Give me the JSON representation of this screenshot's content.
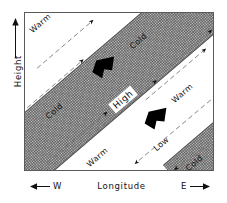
{
  "figure": {
    "type": "meteorological-cross-section",
    "background_color": "#ffffff",
    "frame_color": "#5a5a5a",
    "shade_color": "#c9c9c9"
  },
  "axes": {
    "y": {
      "label": "Height",
      "arrow": "up-arrow-icon",
      "direction": "increasing-upward"
    },
    "x": {
      "label": "Longitude",
      "west_label": "W",
      "east_label": "E",
      "west_arrow": "left-arrow-icon",
      "east_arrow": "right-arrow-icon"
    }
  },
  "regions": [
    {
      "name": "upper-left-corner",
      "label": "Warm",
      "shaded": true
    },
    {
      "name": "central-band",
      "label": "High",
      "shaded": true,
      "boundary_upper_labels": [
        "Cold",
        "Cold"
      ],
      "boundary_lower_labels": [
        "Warm",
        "Warm"
      ]
    },
    {
      "name": "lower-right-corner",
      "label": "Cold",
      "shaded": true
    },
    {
      "name": "below-band",
      "label": "Low",
      "shaded": false
    }
  ],
  "labels": {
    "warm_top_left": "Warm",
    "cold_upper_right": "Cold",
    "cold_upper_left": "Cold",
    "high_center": "High",
    "warm_lower_right": "Warm",
    "warm_lower_left": "Warm",
    "low_lower_right": "Low",
    "cold_bottom_right": "Cold"
  },
  "flow": {
    "above_band_direction": "northeast",
    "inside_band_direction": "northeast",
    "below_band_direction": "southwest",
    "cross_band_arrow_direction": "southwest",
    "cross_band_arrow_count": 2
  }
}
